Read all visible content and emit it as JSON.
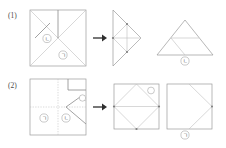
{
  "figure": {
    "kind": "paper-folding-diagram",
    "ink_color": "#9a9a9a",
    "text_color": "#555555",
    "background": "#ffffff",
    "rows": [
      {
        "number": "(1)",
        "arrow": "→",
        "start_shape": {
          "name": "square-with-diagonals",
          "labels": [
            {
              "text": "ㄴ",
              "role": "region-label-left"
            },
            {
              "text": "ㄱ",
              "role": "region-label-bottom"
            }
          ]
        },
        "mid_shape": {
          "name": "left-pointing-triangle-with-diamond"
        },
        "end_shape": {
          "name": "wide-triangle-with-inner-triangle",
          "caption": "ㄴ"
        }
      },
      {
        "number": "(2)",
        "arrow": "→",
        "start_shape": {
          "name": "square-with-creases-and-folded-flap",
          "labels": [
            {
              "text": "ㄱ",
              "role": "region-label-left"
            },
            {
              "text": "ㄴ",
              "role": "region-label-center"
            },
            {
              "text": "",
              "role": "corner-marker-right"
            }
          ]
        },
        "mid_shape": {
          "name": "square-with-inscribed-diamond",
          "labels": [
            {
              "text": "",
              "role": "corner-marker-top-right"
            }
          ]
        },
        "end_shape": {
          "name": "square-with-right-notch",
          "caption": "ㄱ"
        }
      }
    ]
  }
}
